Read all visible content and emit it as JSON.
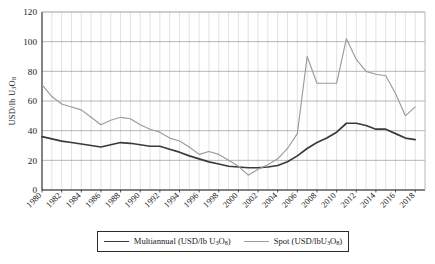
{
  "chart_data": {
    "type": "line",
    "title": "",
    "xlabel": "",
    "ylabel": "USD/lb U3O8",
    "ylim": [
      0,
      120
    ],
    "ytick_values": [
      0,
      20,
      40,
      60,
      80,
      100,
      120
    ],
    "ytick_labels": [
      "0",
      "20",
      "40",
      "60",
      "80",
      "100",
      "120"
    ],
    "xlim": [
      1980,
      2019
    ],
    "xtick_labels": [
      "1980",
      "1982",
      "1984",
      "1986",
      "1988",
      "1990",
      "1992",
      "1994",
      "1996",
      "1998",
      "2000",
      "2002",
      "2004",
      "2006",
      "2008",
      "2010",
      "2012",
      "2014",
      "2016",
      "2018"
    ],
    "grid": "major horizontal and minor vertical (yearly)",
    "legend_position": "below plot, centered, boxed",
    "x": [
      1980,
      1981,
      1982,
      1983,
      1984,
      1985,
      1986,
      1987,
      1988,
      1989,
      1990,
      1991,
      1992,
      1993,
      1994,
      1995,
      1996,
      1997,
      1998,
      1999,
      2000,
      2001,
      2002,
      2003,
      2004,
      2005,
      2006,
      2007,
      2008,
      2009,
      2010,
      2011,
      2012,
      2013,
      2014,
      2015,
      2016,
      2017,
      2018
    ],
    "series": [
      {
        "name": "Multiannual (USD/lb U3O8)",
        "color": "#3a3a3a",
        "values": [
          36,
          34.5,
          33,
          32,
          31,
          30,
          29,
          30.5,
          32,
          31.5,
          30.5,
          29.5,
          29.5,
          27.5,
          25.5,
          23,
          21,
          19,
          17.5,
          16,
          15.5,
          15,
          15,
          15.5,
          16.5,
          19,
          23,
          28,
          32,
          35,
          39,
          45,
          45,
          43.5,
          41,
          41,
          38,
          35,
          34
        ]
      },
      {
        "name": "Spot (USD/lbU3O8)",
        "color": "#9b9b9b",
        "values": [
          71,
          63,
          58,
          56,
          54,
          49,
          44,
          47,
          49,
          48,
          44,
          41,
          39,
          35,
          33,
          29,
          24,
          26,
          24,
          20,
          16,
          10,
          14,
          17,
          21,
          28,
          38,
          90,
          72,
          72,
          72,
          102,
          88,
          80,
          78,
          77,
          65,
          50,
          56
        ]
      }
    ]
  },
  "axis": {
    "ylabel_prefix": "USD/lb U",
    "ylabel_sub1": "3",
    "ylabel_mid": "O",
    "ylabel_sub2": "8"
  },
  "legend": {
    "entries": [
      {
        "key": "multiannual",
        "prefix": "Multiannual (USD/lb U",
        "sub1": "3",
        "mid": "O",
        "sub2": "8",
        "suffix": ")"
      },
      {
        "key": "spot",
        "prefix": "Spot (USD/lbU",
        "sub1": "3",
        "mid": "O",
        "sub2": "8",
        "suffix": ")"
      }
    ]
  }
}
